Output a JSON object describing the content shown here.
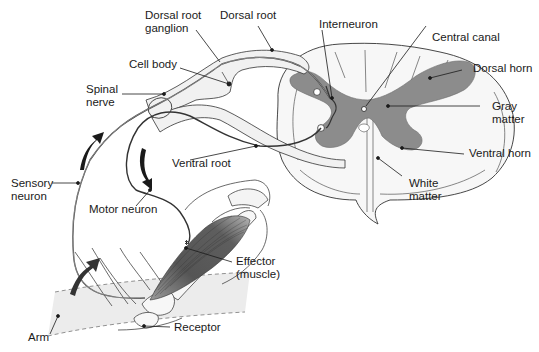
{
  "diagram": {
    "colors": {
      "line": "#2a2a2a",
      "nerve_fill": "#f1f1f1",
      "gray_matter": "#8c8c8c",
      "white_matter": "#f7f7f7",
      "muscle": "#5a5a5a",
      "arm_band": "#ececec",
      "arrow": "#1a1a1a"
    },
    "labels": {
      "dorsal_root_ganglion": [
        "Dorsal root",
        "ganglion"
      ],
      "dorsal_root": "Dorsal root",
      "interneuron": "Interneuron",
      "central_canal": "Central canal",
      "cell_body": "Cell body",
      "spinal_nerve": [
        "Spinal",
        "nerve"
      ],
      "dorsal_horn": "Dorsal horn",
      "gray_matter": [
        "Gray",
        "matter"
      ],
      "ventral_root": "Ventral root",
      "ventral_horn": "Ventral horn",
      "white_matter": [
        "White",
        "matter"
      ],
      "sensory_neuron": [
        "Sensory",
        "neuron"
      ],
      "motor_neuron": "Motor neuron",
      "effector": [
        "Effector",
        "(muscle)"
      ],
      "receptor": "Receptor",
      "arm": "Arm"
    }
  }
}
